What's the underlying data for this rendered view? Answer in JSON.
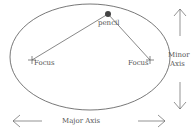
{
  "diagram": {
    "labels": {
      "pencil": "pencil",
      "focus_left": "Focus",
      "focus_right": "Focus",
      "minor_axis_line1": "Minor",
      "minor_axis_line2": "Axis",
      "major_axis": "Major Axis"
    },
    "colors": {
      "stroke": "#555555",
      "pencil_fill": "#444444"
    }
  }
}
